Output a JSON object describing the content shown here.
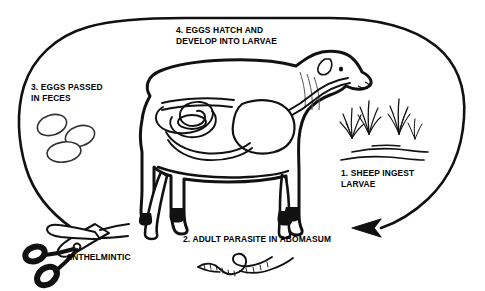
{
  "diagram": {
    "style": {
      "ink_color": "#000000",
      "background_color": "#ffffff"
    },
    "cycle": {
      "direction": "counterclockwise",
      "arrowhead_label": "cycle-arrowhead",
      "interrupted_at": "anthelmintic-scissors"
    },
    "steps": [
      {
        "id": "step1",
        "number": "1.",
        "line1": "1. SHEEP INGEST",
        "line2": "LARVAE",
        "icon": "grass-tuft-icon"
      },
      {
        "id": "step2",
        "number": "2.",
        "line1": "2. ADULT PARASITE IN ABOMASUM",
        "line2": "",
        "icon": "parasite-worm-icon"
      },
      {
        "id": "step3",
        "number": "3.",
        "line1": "3. EGGS PASSED",
        "line2": "IN FECES",
        "icon": "parasite-eggs-icon"
      },
      {
        "id": "step4",
        "number": "4.",
        "line1": "4. EGGS HATCH AND",
        "line2": "DEVELOP INTO LARVAE",
        "icon": ""
      }
    ],
    "treatment": {
      "label": "ANTHELMINTIC",
      "icon": "scissors-icon"
    },
    "illustration": {
      "animal": "sheep",
      "facing": "right",
      "internal_organs": [
        "intestines",
        "abomasum",
        "esophagus"
      ]
    }
  }
}
